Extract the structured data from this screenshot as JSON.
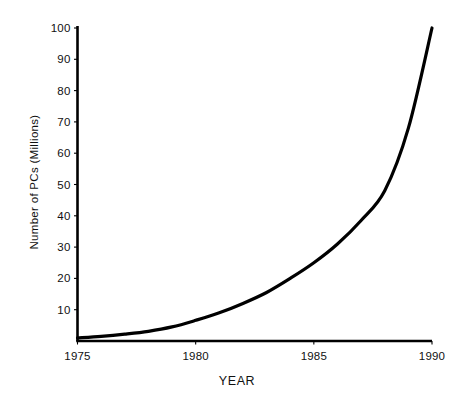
{
  "chart_data": {
    "type": "line",
    "title": "",
    "subtitle": "",
    "xlabel": "YEAR",
    "ylabel": "Number of PCs (Millions)",
    "xlim": [
      1975,
      1990
    ],
    "ylim": [
      0,
      100
    ],
    "grid": false,
    "legend": null,
    "legend_position": "none",
    "x_tick_labels": [
      "1975",
      "1980",
      "1985",
      "1990"
    ],
    "x_tick_values": [
      1975,
      1980,
      1985,
      1990
    ],
    "y_tick_labels": [
      "10",
      "20",
      "30",
      "40",
      "50",
      "60",
      "70",
      "80",
      "90",
      "100"
    ],
    "y_tick_values": [
      10,
      20,
      30,
      40,
      50,
      60,
      70,
      80,
      90,
      100
    ],
    "series": [
      {
        "name": "Number of PCs (Millions)",
        "color": "#000000",
        "line_width": 3.2,
        "x": [
          1975,
          1976,
          1977,
          1978,
          1979,
          1980,
          1981,
          1982,
          1983,
          1984,
          1985,
          1986,
          1987,
          1988,
          1989,
          1990
        ],
        "values": [
          1.0,
          1.5,
          2.2,
          3.1,
          4.5,
          6.6,
          9.0,
          12.0,
          15.5,
          20.0,
          25.0,
          31.0,
          38.5,
          48.0,
          68.0,
          100.0
        ]
      }
    ],
    "axis_color": "#000000",
    "axis_line_width": 2.6,
    "background": "#ffffff"
  }
}
